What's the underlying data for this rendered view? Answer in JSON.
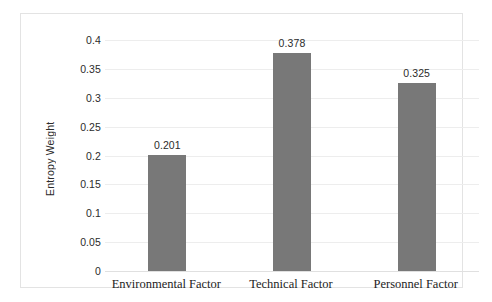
{
  "chart_data": {
    "type": "bar",
    "title": "",
    "subtitle": "",
    "xlabel": "",
    "ylabel": "Entropy Weight",
    "categories": [
      "Environmental Factor",
      "Technical Factor",
      "Personnel Factor"
    ],
    "values": [
      0.201,
      0.378,
      0.325
    ],
    "value_labels": [
      "0.201",
      "0.378",
      "0.325"
    ],
    "series": [
      {
        "name": "Entropy Weight",
        "values": [
          0.201,
          0.378,
          0.325
        ]
      }
    ],
    "ylim": [
      0,
      0.4
    ],
    "ytick_values": [
      0,
      0.05,
      0.1,
      0.15,
      0.2,
      0.25,
      0.3,
      0.35,
      0.4
    ],
    "ytick_labels": [
      "0",
      "0.05",
      "0.1",
      "0.15",
      "0.2",
      "0.25",
      "0.3",
      "0.35",
      "0.4"
    ],
    "grid": true,
    "grid_axis": "y",
    "legend": false,
    "legend_position": "none",
    "annotations": [],
    "colors": {
      "bar": "#787878",
      "gridline": "#ededed",
      "baseline": "#e0e0e0",
      "frame_border": "#e3e3e3",
      "background": "#ffffff",
      "tick_text": "#2b2b2b",
      "category_text": "#1d1d1d"
    }
  }
}
